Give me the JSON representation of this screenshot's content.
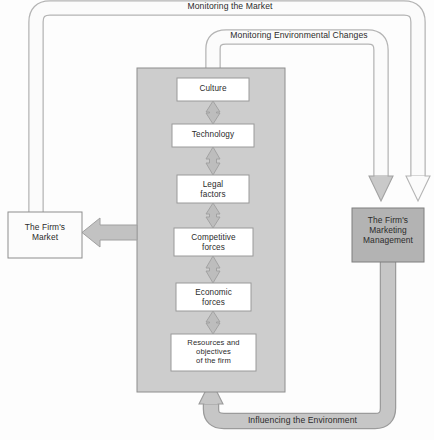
{
  "diagram": {
    "bands": {
      "monitoring_market": "Monitoring the Market",
      "monitoring_environmental_changes": "Monitoring Environmental Changes",
      "influencing_environment": "Influencing the Environment"
    },
    "entities": {
      "firms_market": "The Firm's\nMarket",
      "firms_market_line1": "The Firm's",
      "firms_market_line2": "Market",
      "marketing_management_line1": "The Firm's",
      "marketing_management_line2": "Marketing",
      "marketing_management_line3": "Management"
    },
    "environment_stack": [
      {
        "id": "culture",
        "label": "Culture",
        "lines": [
          "Culture"
        ]
      },
      {
        "id": "technology",
        "label": "Technology",
        "lines": [
          "Technology"
        ]
      },
      {
        "id": "legal-factors",
        "label": "Legal factors",
        "lines": [
          "Legal",
          "factors"
        ]
      },
      {
        "id": "competitive-forces",
        "label": "Competitive forces",
        "lines": [
          "Competitive",
          "forces"
        ]
      },
      {
        "id": "economic-forces",
        "label": "Economic forces",
        "lines": [
          "Economic",
          "forces"
        ]
      },
      {
        "id": "resources-objectives",
        "label": "Resources and objectives of the firm",
        "lines": [
          "Resources and",
          "objectives",
          "of the firm"
        ]
      }
    ],
    "colors": {
      "panel_fill": "#cdcdcd",
      "panel_stroke": "#8e8e8e",
      "box_fill": "#ffffff",
      "box_stroke": "#9a9a9a",
      "arrow_fill": "#b9b9b9",
      "arrow_stroke": "#9a9a9a",
      "band_light_fill": "#fbfbfb",
      "band_light_stroke": "#b4b4b4",
      "band_gray_fill": "#c6c6c6",
      "band_gray_stroke": "#9b9b9b",
      "mgmt_fill": "#b3b3b3",
      "mgmt_stroke": "#7f7f7f",
      "text": "#2b2b2b"
    }
  }
}
